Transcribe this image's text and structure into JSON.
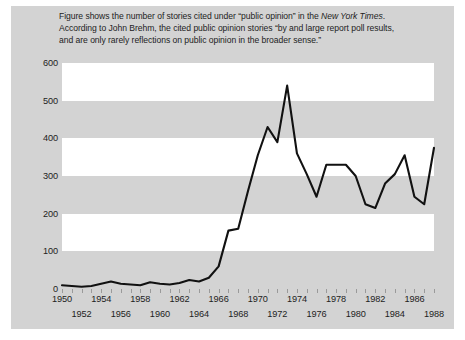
{
  "caption": {
    "lines": [
      [
        {
          "t": "Figure shows the number of stories cited under “public opinion” in the ",
          "i": false
        },
        {
          "t": "New York Times",
          "i": true
        },
        {
          "t": ".",
          "i": false
        }
      ],
      [
        {
          "t": "According to John Brehm, the cited public opinion stories “by and large report poll results,",
          "i": false
        }
      ],
      [
        {
          "t": "and are only rarely reflections on public opinion in the broader sense.”",
          "i": false
        }
      ]
    ]
  },
  "colors": {
    "panel_background": "#d3d3d3",
    "band_white": "#ffffff",
    "line": "#111111",
    "text": "#1d1d1d",
    "tick": "#9a9a9a",
    "page_background": "#ffffff"
  },
  "chart_data": {
    "type": "line",
    "title": "",
    "xlabel": "",
    "ylabel": "",
    "xlim": [
      1950,
      1988
    ],
    "ylim": [
      0,
      600
    ],
    "ytick_labels": [
      "0",
      "100",
      "200",
      "300",
      "400",
      "500",
      "600"
    ],
    "yticks": [
      0,
      100,
      200,
      300,
      400,
      500,
      600
    ],
    "xtick_labels_row0": [
      "1950",
      "1954",
      "1958",
      "1962",
      "1966",
      "1970",
      "1974",
      "1978",
      "1982",
      "1986"
    ],
    "xtick_labels_row1": [
      "1952",
      "1956",
      "1960",
      "1964",
      "1968",
      "1972",
      "1976",
      "1980",
      "1984",
      "1988"
    ],
    "xticks": [
      1950,
      1951,
      1952,
      1953,
      1954,
      1955,
      1956,
      1957,
      1958,
      1959,
      1960,
      1961,
      1962,
      1963,
      1964,
      1965,
      1966,
      1967,
      1968,
      1969,
      1970,
      1971,
      1972,
      1973,
      1974,
      1975,
      1976,
      1977,
      1978,
      1979,
      1980,
      1981,
      1982,
      1983,
      1984,
      1985,
      1986,
      1987,
      1988
    ],
    "grid": "horizontal-banded",
    "legend": "none",
    "x": [
      1950,
      1951,
      1952,
      1953,
      1954,
      1955,
      1956,
      1957,
      1958,
      1959,
      1960,
      1961,
      1962,
      1963,
      1964,
      1965,
      1966,
      1967,
      1968,
      1969,
      1970,
      1971,
      1972,
      1973,
      1974,
      1975,
      1976,
      1977,
      1978,
      1979,
      1980,
      1981,
      1982,
      1983,
      1984,
      1985,
      1986,
      1987,
      1988
    ],
    "values": [
      10,
      8,
      6,
      8,
      14,
      20,
      14,
      12,
      10,
      18,
      14,
      12,
      16,
      24,
      20,
      30,
      60,
      155,
      160,
      260,
      355,
      430,
      390,
      540,
      360,
      305,
      245,
      330,
      330,
      330,
      300,
      225,
      215,
      280,
      305,
      355,
      245,
      225,
      375
    ],
    "series": [
      {
        "name": "Stories citing “public opinion” in the New York Times",
        "values": [
          10,
          8,
          6,
          8,
          14,
          20,
          14,
          12,
          10,
          18,
          14,
          12,
          16,
          24,
          20,
          30,
          60,
          155,
          160,
          260,
          355,
          430,
          390,
          540,
          360,
          305,
          245,
          330,
          330,
          330,
          300,
          225,
          215,
          280,
          305,
          355,
          245,
          225,
          375
        ]
      }
    ],
    "bands": [
      {
        "from": 100,
        "to": 200
      },
      {
        "from": 300,
        "to": 400
      },
      {
        "from": 500,
        "to": 600
      }
    ]
  }
}
